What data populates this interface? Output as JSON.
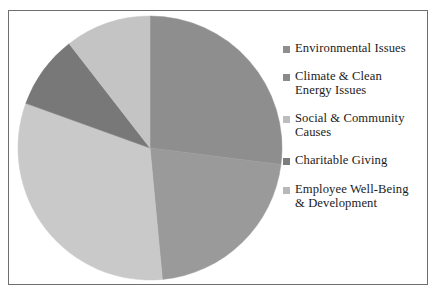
{
  "chart_data": {
    "type": "pie",
    "title": "",
    "xlabel": "",
    "ylabel": "",
    "legend_position": "right",
    "grid": false,
    "start_angle_deg": 0,
    "direction": "clockwise",
    "categories": [
      "Environmental Issues",
      "Climate & Clean Energy Issues",
      "Social & Community Causes",
      "Charitable Giving",
      "Employee Well-Being & Development"
    ],
    "values": [
      27,
      21.5,
      32,
      9,
      10.5
    ],
    "units": "percent",
    "colors": [
      "#8e8e8e",
      "#9a9a9a",
      "#c9c9c9",
      "#787878",
      "#c4c4c4"
    ],
    "slices": [
      {
        "label": "Environmental Issues",
        "value": 27,
        "color": "#8e8e8e",
        "start_deg": 0,
        "end_deg": 97.2,
        "swatch_color": "#8e8e8e"
      },
      {
        "label": "Climate & Clean\nEnergy Issues",
        "value": 21.5,
        "color": "#9a9a9a",
        "start_deg": 97.2,
        "end_deg": 174.6,
        "swatch_color": "#8a8a8a"
      },
      {
        "label": "Social & Community\nCauses",
        "value": 32,
        "color": "#c9c9c9",
        "start_deg": 174.6,
        "end_deg": 289.8,
        "swatch_color": "#bdbdbd"
      },
      {
        "label": "Charitable Giving",
        "value": 9,
        "color": "#787878",
        "start_deg": 289.8,
        "end_deg": 322.2,
        "swatch_color": "#7d7d7d"
      },
      {
        "label": "Employee Well-Being\n& Development",
        "value": 10.5,
        "color": "#c4c4c4",
        "start_deg": 322.2,
        "end_deg": 360,
        "swatch_color": "#b8b8b8"
      }
    ]
  },
  "figure": {
    "border_color": "#6f6f6f",
    "background_color": "#ffffff"
  }
}
